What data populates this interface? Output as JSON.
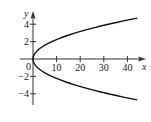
{
  "chart_data": {
    "type": "line",
    "title": "",
    "xlabel": "x",
    "ylabel": "y",
    "xlim": [
      -2,
      47
    ],
    "ylim": [
      -5.5,
      5.5
    ],
    "x_ticks": [
      10,
      20,
      30,
      40
    ],
    "y_ticks": [
      4,
      2,
      -2,
      -4
    ],
    "x_tick_labels": [
      "10",
      "20",
      "30",
      "40"
    ],
    "y_tick_labels": [
      "4",
      "2",
      "−2",
      "−4"
    ],
    "origin_label": "0",
    "grid": false,
    "series": [
      {
        "name": "x = 2y^2",
        "equation": "x = 2y^2",
        "y_range": [
          -4.7,
          4.7
        ],
        "points": [
          {
            "x": 44.2,
            "y": 4.7
          },
          {
            "x": 32,
            "y": 4
          },
          {
            "x": 18,
            "y": 3
          },
          {
            "x": 8,
            "y": 2
          },
          {
            "x": 2,
            "y": 1
          },
          {
            "x": 0,
            "y": 0
          },
          {
            "x": 2,
            "y": -1
          },
          {
            "x": 8,
            "y": -2
          },
          {
            "x": 18,
            "y": -3
          },
          {
            "x": 32,
            "y": -4
          },
          {
            "x": 44.2,
            "y": -4.7
          }
        ]
      }
    ]
  }
}
